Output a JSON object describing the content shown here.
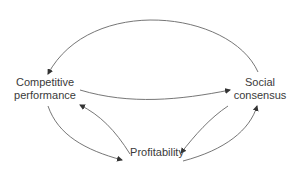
{
  "diagram": {
    "nodes": {
      "competitive": {
        "line1": "Competitive",
        "line2": "performance"
      },
      "social": {
        "line1": "Social",
        "line2": "consensus"
      },
      "profitability": {
        "label": "Profitability"
      }
    },
    "edges": [
      {
        "from": "Social consensus",
        "to": "Competitive performance",
        "style": "arc-top"
      },
      {
        "from": "Competitive performance",
        "to": "Social consensus",
        "style": "curve-middle"
      },
      {
        "from": "Competitive performance",
        "to": "Profitability",
        "style": "curve-lower-left"
      },
      {
        "from": "Profitability",
        "to": "Competitive performance",
        "style": "curve-upper-left"
      },
      {
        "from": "Social consensus",
        "to": "Profitability",
        "style": "curve-upper-right"
      },
      {
        "from": "Profitability",
        "to": "Social consensus",
        "style": "curve-lower-right"
      }
    ],
    "colors": {
      "line": "#555555",
      "text": "#3a3a3a",
      "background": "#ffffff"
    }
  }
}
